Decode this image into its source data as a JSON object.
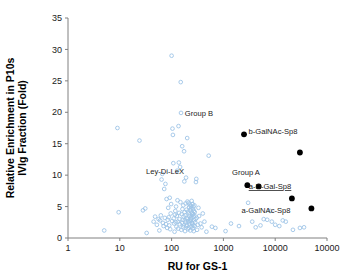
{
  "chart_data": {
    "type": "scatter",
    "title": "",
    "xlabel": "RU for GS-1",
    "ylabel": "Relative Enrichment in P10s IVIg Fraction (Fold)",
    "ylabel_line1": "Relative Enrichment in P10s",
    "ylabel_line2": "IVIg Fraction (Fold)",
    "xscale": "log",
    "yscale": "linear",
    "xlim": [
      1,
      100000
    ],
    "ylim": [
      0,
      35
    ],
    "grid": false,
    "legend": "none",
    "xticks": [
      1,
      10,
      100,
      1000,
      10000,
      100000
    ],
    "xtick_labels": [
      "1",
      "10",
      "100",
      "1000",
      "10000",
      "10000"
    ],
    "yticks": [
      0,
      5,
      10,
      15,
      20,
      25,
      30,
      35
    ],
    "ytick_labels": [
      "0",
      "5",
      "10",
      "15",
      "20",
      "25",
      "30",
      "35"
    ],
    "colors": {
      "open_marker": "#9ec4e6",
      "filled_marker": "#000000",
      "axis": "#808080",
      "text": "#1a1a1a"
    },
    "series": [
      {
        "name": "Glycan array signals",
        "marker": "open-circle",
        "color": "#9ec4e6",
        "points": [
          [
            5.0,
            1.2
          ],
          [
            9.0,
            17.5
          ],
          [
            9.5,
            4.1
          ],
          [
            24.0,
            15.5
          ],
          [
            28.0,
            4.4
          ],
          [
            31.0,
            4.7
          ],
          [
            33.0,
            0.8
          ],
          [
            45.0,
            2.6
          ],
          [
            48.0,
            3.4
          ],
          [
            52.0,
            2.1
          ],
          [
            56.0,
            3.0
          ],
          [
            58.0,
            1.2
          ],
          [
            60.0,
            2.8
          ],
          [
            62.0,
            3.6
          ],
          [
            64.0,
            9.3
          ],
          [
            66.0,
            10.2
          ],
          [
            68.0,
            2.4
          ],
          [
            70.0,
            1.9
          ],
          [
            72.0,
            7.8
          ],
          [
            74.0,
            3.2
          ],
          [
            76.0,
            8.6
          ],
          [
            78.0,
            2.2
          ],
          [
            80.0,
            6.2
          ],
          [
            82.0,
            1.6
          ],
          [
            84.0,
            2.9
          ],
          [
            86.0,
            4.8
          ],
          [
            88.0,
            3.3
          ],
          [
            90.0,
            2.0
          ],
          [
            92.0,
            6.4
          ],
          [
            94.0,
            1.4
          ],
          [
            96.0,
            3.9
          ],
          [
            98.0,
            5.4
          ],
          [
            100.0,
            29.0
          ],
          [
            102.0,
            2.7
          ],
          [
            104.0,
            17.4
          ],
          [
            106.0,
            16.4
          ],
          [
            108.0,
            11.9
          ],
          [
            110.0,
            3.1
          ],
          [
            112.0,
            2.3
          ],
          [
            114.0,
            1.0
          ],
          [
            116.0,
            3.7
          ],
          [
            118.0,
            4.3
          ],
          [
            120.0,
            2.5
          ],
          [
            122.0,
            5.0
          ],
          [
            124.0,
            1.8
          ],
          [
            126.0,
            3.5
          ],
          [
            128.0,
            10.7
          ],
          [
            130.0,
            6.0
          ],
          [
            132.0,
            2.6
          ],
          [
            134.0,
            1.5
          ],
          [
            136.0,
            17.8
          ],
          [
            138.0,
            12.0
          ],
          [
            140.0,
            4.0
          ],
          [
            142.0,
            3.0
          ],
          [
            144.0,
            2.2
          ],
          [
            146.0,
            11.3
          ],
          [
            148.0,
            5.7
          ],
          [
            150.0,
            24.8
          ],
          [
            152.0,
            19.9
          ],
          [
            154.0,
            1.3
          ],
          [
            156.0,
            3.8
          ],
          [
            158.0,
            2.4
          ],
          [
            160.0,
            14.6
          ],
          [
            162.0,
            4.6
          ],
          [
            164.0,
            2.9
          ],
          [
            166.0,
            1.7
          ],
          [
            168.0,
            5.2
          ],
          [
            170.0,
            3.4
          ],
          [
            172.0,
            2.0
          ],
          [
            174.0,
            13.8
          ],
          [
            176.0,
            9.0
          ],
          [
            178.0,
            4.1
          ],
          [
            180.0,
            2.8
          ],
          [
            182.0,
            1.1
          ],
          [
            184.0,
            3.6
          ],
          [
            186.0,
            5.5
          ],
          [
            188.0,
            2.5
          ],
          [
            190.0,
            9.6
          ],
          [
            192.0,
            1.9
          ],
          [
            194.0,
            4.5
          ],
          [
            196.0,
            3.2
          ],
          [
            198.0,
            2.1
          ],
          [
            200.0,
            15.9
          ],
          [
            202.0,
            5.8
          ],
          [
            204.0,
            3.0
          ],
          [
            206.0,
            1.4
          ],
          [
            208.0,
            4.2
          ],
          [
            210.0,
            2.6
          ],
          [
            212.0,
            5.6
          ],
          [
            214.0,
            3.9
          ],
          [
            216.0,
            1.6
          ],
          [
            218.0,
            4.9
          ],
          [
            220.0,
            2.3
          ],
          [
            222.0,
            3.5
          ],
          [
            224.0,
            5.3
          ],
          [
            226.0,
            2.7
          ],
          [
            228.0,
            4.4
          ],
          [
            230.0,
            1.2
          ],
          [
            232.0,
            3.1
          ],
          [
            234.0,
            5.1
          ],
          [
            236.0,
            2.9
          ],
          [
            238.0,
            4.7
          ],
          [
            240.0,
            3.3
          ],
          [
            242.0,
            1.8
          ],
          [
            244.0,
            5.9
          ],
          [
            246.0,
            2.4
          ],
          [
            248.0,
            4.0
          ],
          [
            250.0,
            3.7
          ],
          [
            252.0,
            2.2
          ],
          [
            254.0,
            5.4
          ],
          [
            256.0,
            1.5
          ],
          [
            258.0,
            3.8
          ],
          [
            260.0,
            4.6
          ],
          [
            262.0,
            2.0
          ],
          [
            264.0,
            5.0
          ],
          [
            266.0,
            3.4
          ],
          [
            268.0,
            1.1
          ],
          [
            270.0,
            4.3
          ],
          [
            272.0,
            2.8
          ],
          [
            274.0,
            3.6
          ],
          [
            276.0,
            5.2
          ],
          [
            278.0,
            1.9
          ],
          [
            280.0,
            4.1
          ],
          [
            285.0,
            2.5
          ],
          [
            290.0,
            3.0
          ],
          [
            295.0,
            8.9
          ],
          [
            300.0,
            9.4
          ],
          [
            305.0,
            3.2
          ],
          [
            310.0,
            1.3
          ],
          [
            320.0,
            2.1
          ],
          [
            330.0,
            4.8
          ],
          [
            340.0,
            3.5
          ],
          [
            360.0,
            2.3
          ],
          [
            380.0,
            1.7
          ],
          [
            400.0,
            3.9
          ],
          [
            430.0,
            2.6
          ],
          [
            470.0,
            1.0
          ],
          [
            520.0,
            13.1
          ],
          [
            600.0,
            1.8
          ],
          [
            700.0,
            1.6
          ],
          [
            1100.0,
            1.1
          ],
          [
            1400.0,
            2.3
          ],
          [
            2000.0,
            1.9
          ],
          [
            3000.0,
            5.6
          ],
          [
            3600.0,
            2.6
          ],
          [
            4200.0,
            1.7
          ],
          [
            5200.0,
            2.0
          ],
          [
            6000.0,
            3.0
          ],
          [
            7000.0,
            2.9
          ],
          [
            8000.0,
            4.3
          ],
          [
            8600.0,
            2.6
          ],
          [
            10000.0,
            2.1
          ],
          [
            12000.0,
            1.9
          ],
          [
            14000.0,
            2.8
          ],
          [
            16000.0,
            2.6
          ],
          [
            22000.0,
            1.3
          ],
          [
            30000.0,
            1.6
          ],
          [
            36000.0,
            1.7
          ]
        ]
      },
      {
        "name": "Highlighted glycans",
        "marker": "filled-circle",
        "color": "#000000",
        "points": [
          {
            "x": 2500,
            "y": 16.5,
            "label": "Group B"
          },
          {
            "x": 30000,
            "y": 13.6,
            "label": "b-GalNAc-Sp8"
          },
          {
            "x": 2900,
            "y": 8.4,
            "label": "Group A"
          },
          {
            "x": 4800,
            "y": 8.2,
            "label": "Group A"
          },
          {
            "x": 21000,
            "y": 6.3,
            "label": "a-D-Gal-Sp8"
          },
          {
            "x": 50000,
            "y": 4.7,
            "label": "a-GalNAc-Sp8"
          }
        ]
      }
    ],
    "annotations": [
      {
        "text": "Group B",
        "x_px": 199,
        "y_px": 116,
        "underline": false
      },
      {
        "text": "b-GalNAc-Sp8",
        "x_px": 273,
        "y_px": 134,
        "underline": false
      },
      {
        "text": "Ley-Di-LeX",
        "x_px": 165,
        "y_px": 174,
        "underline": false
      },
      {
        "text": "Group A",
        "x_px": 246,
        "y_px": 175,
        "underline": false
      },
      {
        "text": "a-D-Gal-Sp8",
        "x_px": 270,
        "y_px": 189,
        "underline": true
      },
      {
        "text": "a-GalNAc-Sp8",
        "x_px": 266,
        "y_px": 213,
        "underline": false
      }
    ]
  }
}
